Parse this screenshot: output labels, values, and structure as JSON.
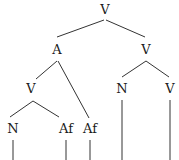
{
  "diagram": {
    "type": "syntax-tree",
    "nodes": [
      {
        "id": "root",
        "label": "V",
        "x": 105,
        "y": 13
      },
      {
        "id": "a",
        "label": "A",
        "x": 57,
        "y": 53
      },
      {
        "id": "v_right",
        "label": "V",
        "x": 146,
        "y": 53
      },
      {
        "id": "v_left",
        "label": "V",
        "x": 31,
        "y": 92
      },
      {
        "id": "n_right",
        "label": "N",
        "x": 122,
        "y": 92
      },
      {
        "id": "v_leaf",
        "label": "V",
        "x": 170,
        "y": 92
      },
      {
        "id": "n_left",
        "label": "N",
        "x": 13,
        "y": 132
      },
      {
        "id": "af1",
        "label": "Af",
        "x": 66,
        "y": 132
      },
      {
        "id": "af2",
        "label": "Af",
        "x": 90,
        "y": 132
      }
    ],
    "edges": [
      {
        "from": "root",
        "to": "a"
      },
      {
        "from": "root",
        "to": "v_right"
      },
      {
        "from": "a",
        "to": "v_left"
      },
      {
        "from": "a",
        "to": "af2"
      },
      {
        "from": "v_right",
        "to": "n_right"
      },
      {
        "from": "v_right",
        "to": "v_leaf"
      },
      {
        "from": "v_left",
        "to": "n_left"
      },
      {
        "from": "v_left",
        "to": "af1"
      }
    ]
  },
  "labels": {
    "root": "V",
    "a": "A",
    "v_right": "V",
    "v_left": "V",
    "n_right": "N",
    "v_leaf": "V",
    "n_left": "N",
    "af1": "Af",
    "af2": "Af"
  }
}
